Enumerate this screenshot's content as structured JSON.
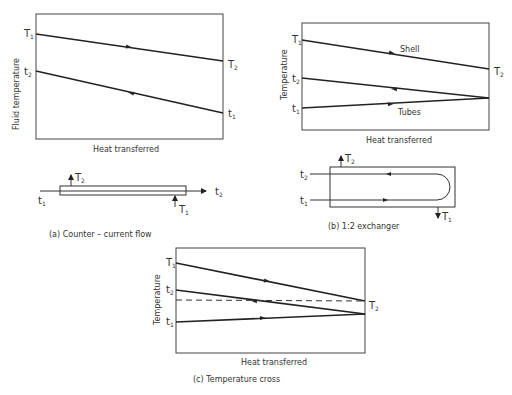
{
  "panel_a": {
    "ylabel": "Fluid temperature",
    "xlabel": "Heat transferred",
    "hot_in": "T",
    "hot_in_sub": "1",
    "hot_out": "T",
    "hot_out_sub": "2",
    "cold_in": "t",
    "cold_in_sub": "1",
    "cold_out": "t",
    "cold_out_sub": "2",
    "caption": "(a)  Counter – current flow"
  },
  "panel_b": {
    "ylabel": "Temperature",
    "xlabel": "Heat transferred",
    "shell_label": "Shell",
    "tubes_label": "Tubes",
    "hot_in": "T",
    "hot_in_sub": "1",
    "hot_out": "T",
    "hot_out_sub": "2",
    "cold_in": "t",
    "cold_in_sub": "1",
    "cold_out": "t",
    "cold_out_sub": "2",
    "caption": "(b)  1:2 exchanger"
  },
  "panel_c": {
    "ylabel": "Temperature",
    "xlabel": "Heat transferred",
    "hot_in": "T",
    "hot_in_sub": "1",
    "hot_out": "T",
    "hot_out_sub": "2",
    "cold_in": "t",
    "cold_in_sub": "1",
    "cold_out": "t",
    "cold_out_sub": "2",
    "caption": "(c)  Temperature cross"
  }
}
